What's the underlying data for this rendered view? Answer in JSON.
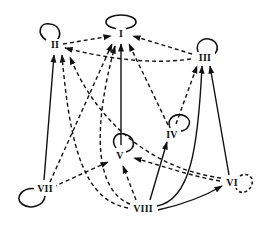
{
  "diagram": {
    "type": "directed-graph",
    "colors": {
      "stroke": "#111111",
      "background": "#ffffff"
    },
    "nodes": [
      {
        "id": "I",
        "label": "I"
      },
      {
        "id": "II",
        "label": "II"
      },
      {
        "id": "III",
        "label": "III"
      },
      {
        "id": "IV",
        "label": "IV"
      },
      {
        "id": "V",
        "label": "V"
      },
      {
        "id": "VI",
        "label": "VI"
      },
      {
        "id": "VII",
        "label": "VII"
      },
      {
        "id": "VIII",
        "label": "VIII"
      }
    ],
    "self_loops": [
      {
        "node": "I",
        "style": "solid"
      },
      {
        "node": "II",
        "style": "solid"
      },
      {
        "node": "III",
        "style": "solid"
      },
      {
        "node": "IV",
        "style": "solid"
      },
      {
        "node": "V",
        "style": "solid"
      },
      {
        "node": "VI",
        "style": "dashed"
      },
      {
        "node": "VII",
        "style": "solid"
      }
    ],
    "edges": [
      {
        "from": "II",
        "to": "I",
        "style": "dashed"
      },
      {
        "from": "III",
        "to": "I",
        "style": "dashed"
      },
      {
        "from": "III",
        "to": "II",
        "style": "dashed"
      },
      {
        "from": "V",
        "to": "I",
        "style": "solid"
      },
      {
        "from": "VII",
        "to": "II",
        "style": "solid"
      },
      {
        "from": "VII",
        "to": "I",
        "style": "dashed"
      },
      {
        "from": "VII",
        "to": "V",
        "style": "dashed"
      },
      {
        "from": "VIII",
        "to": "II",
        "style": "dashed"
      },
      {
        "from": "VIII",
        "to": "I",
        "style": "dashed"
      },
      {
        "from": "VIII",
        "to": "V",
        "style": "dashed"
      },
      {
        "from": "VIII",
        "to": "IV",
        "style": "solid"
      },
      {
        "from": "VIII",
        "to": "III",
        "style": "solid"
      },
      {
        "from": "VIII",
        "to": "VI",
        "style": "solid"
      },
      {
        "from": "IV",
        "to": "III",
        "style": "dashed"
      },
      {
        "from": "IV",
        "to": "I",
        "style": "dashed"
      },
      {
        "from": "VI",
        "to": "III",
        "style": "solid"
      },
      {
        "from": "VI",
        "to": "V",
        "style": "dashed"
      },
      {
        "from": "VI",
        "to": "II",
        "style": "dashed"
      }
    ]
  }
}
